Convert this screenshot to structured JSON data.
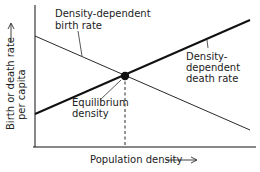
{
  "diagram": {
    "title": "",
    "labels": {
      "birth_rate_line1": "Density-dependent",
      "birth_rate_line2": "birth rate",
      "death_rate_line1": "Density-",
      "death_rate_line2": "dependent",
      "death_rate_line3": "death rate",
      "equilibrium_line1": "Equilibrium",
      "equilibrium_line2": "density",
      "x_axis": "Population density",
      "y_axis_line1": "Birth or death rate",
      "y_axis_line2": "per capita"
    },
    "colors": {
      "line": "#111111",
      "text": "#222222",
      "background": "#ffffff"
    }
  }
}
